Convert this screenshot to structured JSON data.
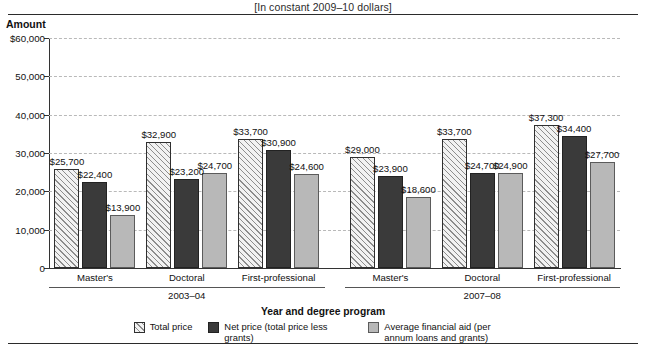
{
  "header": {
    "subtitle": "[In constant 2009–10 dollars]",
    "y_axis_title": "Amount",
    "x_axis_title": "Year and degree program"
  },
  "legend": {
    "items": [
      {
        "key": "total",
        "label": "Total price",
        "color": "#f2f2f2"
      },
      {
        "key": "net",
        "label": "Net price (total price less grants)",
        "color": "#3a3a3a"
      },
      {
        "key": "aid",
        "label": "Average financial aid (per annum loans and grants)",
        "color": "#b8b8b8"
      }
    ]
  },
  "chart_data": {
    "type": "bar",
    "title": "",
    "subtitle": "[In constant 2009–10 dollars]",
    "xlabel": "Year and degree program",
    "ylabel": "Amount",
    "ylim": [
      0,
      60000
    ],
    "ytick_labels": [
      "$60,000",
      "50,000",
      "40,000",
      "30,000",
      "20,000",
      "10,000",
      "0"
    ],
    "ytick_values": [
      60000,
      50000,
      40000,
      30000,
      20000,
      10000,
      0
    ],
    "grid": true,
    "legend_position": "bottom",
    "groups": [
      "2003–04",
      "2007–08"
    ],
    "categories": [
      "Master's",
      "Doctoral",
      "First-professional",
      "Master's",
      "Doctoral",
      "First-professional"
    ],
    "category_groups": [
      "2003–04",
      "2003–04",
      "2003–04",
      "2007–08",
      "2007–08",
      "2007–08"
    ],
    "series": [
      {
        "name": "Total price",
        "values": [
          25700,
          32900,
          33700,
          29000,
          33700,
          37300
        ],
        "labels": [
          "$25,700",
          "$32,900",
          "$33,700",
          "$29,000",
          "$33,700",
          "$37,300"
        ]
      },
      {
        "name": "Net price (total price less grants)",
        "values": [
          22400,
          23200,
          30900,
          23900,
          24700,
          34400
        ],
        "labels": [
          "$22,400",
          "$23,200",
          "$30,900",
          "$23,900",
          "$24,700",
          "$34,400"
        ]
      },
      {
        "name": "Average financial aid (per annum loans and grants)",
        "values": [
          13900,
          24700,
          24600,
          18600,
          24900,
          27700
        ],
        "labels": [
          "$13,900",
          "$24,700",
          "$24,600",
          "$18,600",
          "$24,900",
          "$27,700"
        ]
      }
    ]
  }
}
